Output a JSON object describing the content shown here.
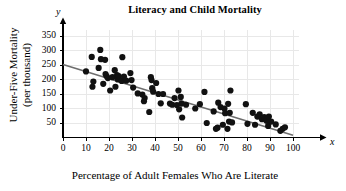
{
  "chart_data": {
    "type": "scatter",
    "title": "Literacy and Child Mortality",
    "xlabel": "Percentage of Adult Females Who Are Literate",
    "ylabel": "Under-Five Mortality (per thousand)",
    "ylabel_line1": "Under-Five Mortality",
    "ylabel_line2": "(per thousand)",
    "x_axis_letter": "x",
    "y_axis_letter": "y",
    "xlim": [
      0,
      100
    ],
    "ylim": [
      0,
      375
    ],
    "xticks": [
      0,
      10,
      20,
      30,
      40,
      50,
      60,
      70,
      80,
      90,
      100
    ],
    "yticks": [
      50,
      100,
      150,
      200,
      250,
      300,
      350
    ],
    "grid": true,
    "grid_color": "#e8e8e8",
    "marker_color": "#111111",
    "marker_size": 3.1,
    "legend": "none",
    "trendline": {
      "label": "least-squares regression line",
      "color": "#6e6e6e",
      "x_start": 0,
      "y_start": 252,
      "x_end": 100,
      "y_end": 8
    },
    "points": [
      [
        10,
        228
      ],
      [
        12.5,
        278
      ],
      [
        12.8,
        175
      ],
      [
        13.2,
        193
      ],
      [
        15.5,
        240
      ],
      [
        16.2,
        302
      ],
      [
        16.5,
        270
      ],
      [
        17.5,
        185
      ],
      [
        18.3,
        268
      ],
      [
        18.5,
        219
      ],
      [
        18.9,
        212
      ],
      [
        19.5,
        205
      ],
      [
        20.5,
        162
      ],
      [
        21.5,
        208
      ],
      [
        22.5,
        232
      ],
      [
        22.8,
        175
      ],
      [
        23.5,
        215
      ],
      [
        23.8,
        200
      ],
      [
        24.2,
        212
      ],
      [
        25.5,
        195
      ],
      [
        25.8,
        277
      ],
      [
        26.5,
        210
      ],
      [
        27.5,
        196
      ],
      [
        29.3,
        222
      ],
      [
        29.8,
        198
      ],
      [
        30.5,
        172
      ],
      [
        32.5,
        152
      ],
      [
        34.5,
        148
      ],
      [
        35.2,
        125
      ],
      [
        35.5,
        136
      ],
      [
        37.5,
        88
      ],
      [
        38.2,
        208
      ],
      [
        38.5,
        198
      ],
      [
        38.8,
        170
      ],
      [
        39.2,
        158
      ],
      [
        40.5,
        188
      ],
      [
        41.5,
        150
      ],
      [
        42.5,
        118
      ],
      [
        43.5,
        150
      ],
      [
        46.5,
        117
      ],
      [
        47.5,
        113
      ],
      [
        48.5,
        136
      ],
      [
        49.5,
        112
      ],
      [
        50.2,
        162
      ],
      [
        50.5,
        97
      ],
      [
        51.2,
        140
      ],
      [
        51.5,
        117
      ],
      [
        51.8,
        69
      ],
      [
        53.5,
        113
      ],
      [
        57.5,
        100
      ],
      [
        59.5,
        115
      ],
      [
        61.5,
        157
      ],
      [
        62.5,
        50
      ],
      [
        65.5,
        90
      ],
      [
        66.5,
        30
      ],
      [
        67.2,
        34
      ],
      [
        67.5,
        120
      ],
      [
        68.5,
        105
      ],
      [
        69.5,
        44
      ],
      [
        70.2,
        100
      ],
      [
        70.5,
        84
      ],
      [
        71.5,
        30
      ],
      [
        71.8,
        116
      ],
      [
        72.2,
        55
      ],
      [
        72.5,
        85
      ],
      [
        72.8,
        162
      ],
      [
        73.5,
        52
      ],
      [
        79.5,
        115
      ],
      [
        80.2,
        47
      ],
      [
        82.5,
        85
      ],
      [
        83.5,
        44
      ],
      [
        84.5,
        72
      ],
      [
        85.5,
        80
      ],
      [
        86.5,
        63
      ],
      [
        87.5,
        70
      ],
      [
        88.5,
        58
      ],
      [
        89.2,
        40
      ],
      [
        89.5,
        72
      ],
      [
        90.5,
        55
      ],
      [
        92.5,
        45
      ],
      [
        94.5,
        23
      ],
      [
        95.5,
        30
      ],
      [
        96.5,
        35
      ]
    ]
  }
}
